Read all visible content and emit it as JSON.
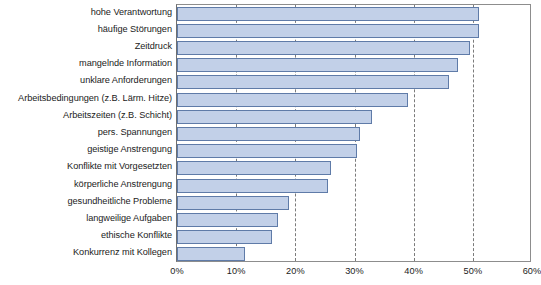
{
  "chart_data": {
    "type": "bar",
    "orientation": "horizontal",
    "title": "",
    "subtitle": "",
    "xlabel": "",
    "ylabel": "",
    "xlim": [
      0,
      60
    ],
    "ylim": null,
    "grid": true,
    "grid_axis": "x",
    "legend": null,
    "legend_position": "none",
    "value_suffix": "%",
    "categories": [
      "hohe Verantwortung",
      "häufige Störungen",
      "Zeitdruck",
      "mangelnde Information",
      "unklare Anforderungen",
      "Arbeitsbedingungen (z.B. Lärm. Hitze)",
      "Arbeitszeiten (z.B. Schicht)",
      "pers. Spannungen",
      "geistige Anstrengung",
      "Konflikte mit Vorgesetzten",
      "körperliche Anstrengung",
      "gesundheitliche Probleme",
      "langweilige Aufgaben",
      "ethische Konflikte",
      "Konkurrenz mit Kollegen"
    ],
    "values": [
      51,
      51,
      49.5,
      47.5,
      46,
      39,
      33,
      31,
      30.5,
      26,
      25.5,
      19,
      17,
      16,
      11.5
    ],
    "ticks": [
      0,
      10,
      20,
      30,
      40,
      50,
      60
    ],
    "tick_labels": [
      "0%",
      "10%",
      "20%",
      "30%",
      "40%",
      "50%",
      "60%"
    ],
    "colors": {
      "bar_fill": "#c2d0e8",
      "bar_border": "#5f7ba8",
      "grid": "#7b7b7b",
      "axis": "#8d8d8d",
      "text": "#1b1b1b",
      "background": "#ffffff"
    }
  }
}
